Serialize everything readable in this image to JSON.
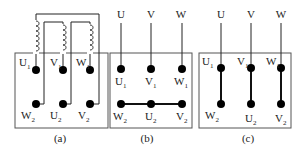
{
  "panels": [
    {
      "caption": "(a)",
      "top_terminals": [
        {
          "main": "U",
          "sub": "1"
        },
        {
          "main": "V",
          "sub": "1"
        },
        {
          "main": "W",
          "sub": "1"
        }
      ],
      "bottom_terminals": [
        {
          "main": "W",
          "sub": "2"
        },
        {
          "main": "U",
          "sub": "2"
        },
        {
          "main": "V",
          "sub": "2"
        }
      ],
      "description": "Three windings connected to terminal box (terminal layout)"
    },
    {
      "caption": "(b)",
      "supply": [
        "U",
        "V",
        "W"
      ],
      "top_terminals": [
        {
          "main": "U",
          "sub": "1"
        },
        {
          "main": "V",
          "sub": "1"
        },
        {
          "main": "W",
          "sub": "1"
        }
      ],
      "bottom_terminals": [
        {
          "main": "W",
          "sub": "2"
        },
        {
          "main": "U",
          "sub": "2"
        },
        {
          "main": "V",
          "sub": "2"
        }
      ],
      "description": "Star (Y) connection: W2-U2-V2 shorted"
    },
    {
      "caption": "(c)",
      "supply": [
        "U",
        "V",
        "W"
      ],
      "top_terminals": [
        {
          "main": "U",
          "sub": "1"
        },
        {
          "main": "V",
          "sub": "1"
        },
        {
          "main": "W",
          "sub": "1"
        }
      ],
      "bottom_terminals": [
        {
          "main": "W",
          "sub": "2"
        },
        {
          "main": "U",
          "sub": "2"
        },
        {
          "main": "V",
          "sub": "2"
        }
      ],
      "description": "Delta connection: U1-W2, V1-U2, W1-V2 linked"
    }
  ]
}
